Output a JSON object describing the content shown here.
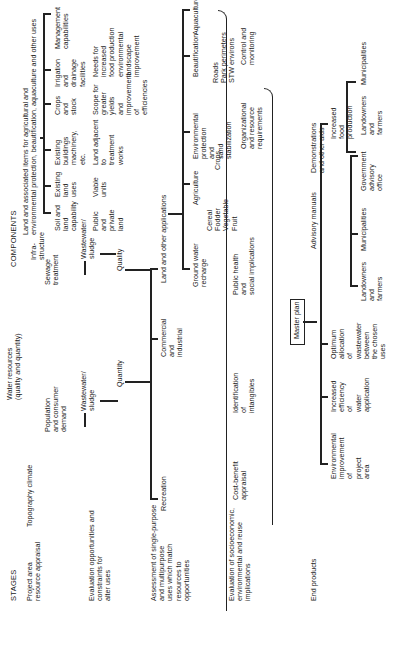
{
  "headers": {
    "stages": "STAGES",
    "components": "COMPONENTS"
  },
  "stages": [
    "Project area\nresource appraisal",
    "Evaluation opportunities and\nconstraints for\nalter uses",
    "Assessment of single-purpose\nand multipurpose\nuses which match\nresources to\nopportunities",
    "Evaluation of socioeconomic,\nenvironmental and reuse\nimplications",
    "End products"
  ],
  "appraisal": {
    "topography": "Topography climate",
    "population": "Population\nand consumer\ndemand",
    "water_resources": "Water resources\n(quality and quantity)",
    "sewage": "Sewage\ntreatment",
    "infrastructure": "Infra-\nstructure",
    "land_items": "Land and associated items for agricultural and\nenvironmental protection, beautification, aquaculture and other uses"
  },
  "land_components": [
    {
      "label": "Soil and\nland\ncapability",
      "sub": "Public\nand\nprivate\nland"
    },
    {
      "label": "Existing\nland\nuses",
      "sub": "Viable\nunits"
    },
    {
      "label": "Existing\nbuildings\nmachinery,\netc.",
      "sub": "Land adjacent\nto\ntreatment\nworks"
    },
    {
      "label": "Crops\nand\nstock",
      "sub": "Scope for\ngreater\nyields\nand\nimprovement\nof\nefficiencies"
    },
    {
      "label": "Irrigation\nand\ndrainage\nfacilities",
      "sub": "Needs for\nincreased\nfood production\nenvironmental\nlandscape\nimprovement"
    },
    {
      "label": "Management\ncapabilities",
      "sub": ""
    }
  ],
  "evaluation": {
    "wastewater_left": "Wastewater/\nsludge",
    "wastewater_right": "Wastewater/\nsludge",
    "quantity": "Quantity",
    "quality": "Quality"
  },
  "assessment": {
    "recreation": "Recreation",
    "commercial": "Commercial\nand\nindustrial",
    "land_other": "Land and other applications",
    "groundwater": "Ground water\nrecharge",
    "agriculture": "Agriculture",
    "crops_list": "Cereal\nFodder\nVegetable\nFruit",
    "crops": "Crops",
    "env_protection": "Environmental\nprotection\nand\nsand\nstabilization",
    "beautification": "Beautification",
    "beautification_sub": "Roads\nPark perimeters\nSTW environs",
    "aquaculture": "Aquaculture"
  },
  "socio": {
    "cost_benefit": "Cost-benefit\nappraisal",
    "intangibles": "Identification\nof\nintangibles",
    "public_health": "Public health\nand\nsocial implications",
    "organizational": "Organizational\nand resource\nrequirements",
    "control": "Control and\nmonitoring"
  },
  "master_plan": "Master plan",
  "end_products": {
    "environmental": "Environmental\nimprovement\nof\nproject\narea",
    "efficiency": "Increased\nefficiency\nof\nwater\napplication",
    "allocation": "Optimum\nallocation\nof\nwastewater\nbetween\nthe chosen\nuses",
    "advisory": "Advisory manuals",
    "advisory_children": [
      "Landowners\nand\nfarmers",
      "Municipalities",
      "Government\nadvisory\noffice"
    ],
    "demonstrations": "Demonstrations\nand other aids",
    "demo_children": [
      "Landowners\nand\nfarmers",
      "Municipalities"
    ],
    "food": "Increased\nfood\nproduction"
  }
}
